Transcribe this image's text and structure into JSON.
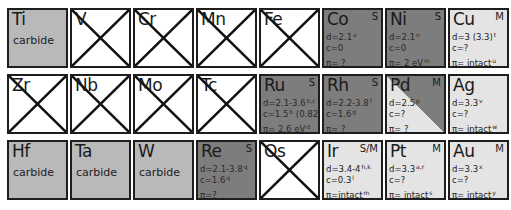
{
  "legend_colors": {
    "carbide": "#b9b9b9",
    "semiconductor_S": "#7d7d7d",
    "metal_M": "#e4e4e4",
    "crossed": "#ffffff"
  },
  "rows": [
    [
      {
        "symbol": "Ti",
        "type": "carbide",
        "sub": "carbide"
      },
      {
        "symbol": "V",
        "type": "crossed"
      },
      {
        "symbol": "Cr",
        "type": "crossed"
      },
      {
        "symbol": "Mn",
        "type": "crossed"
      },
      {
        "symbol": "Fe",
        "type": "crossed"
      },
      {
        "symbol": "Co",
        "type": "semi",
        "tag": "S",
        "d": "d=2.1",
        "d_ref": "a",
        "c": "c=0",
        "c_ref": "",
        "pi": "π= ?",
        "pi_ref": ""
      },
      {
        "symbol": "Ni",
        "type": "semi",
        "tag": "S",
        "d": "d=2.1",
        "d_ref": "n",
        "c": "c=0",
        "c_ref": "",
        "pi": "π= 2 eV",
        "pi_ref": "m"
      },
      {
        "symbol": "Cu",
        "type": "metal",
        "tag": "M",
        "d": "d=3 (3.3)",
        "d_ref": "t",
        "c": "c=?",
        "c_ref": "",
        "pi": "π= intact",
        "pi_ref": "u"
      }
    ],
    [
      {
        "symbol": "Zr",
        "type": "crossed"
      },
      {
        "symbol": "Nb",
        "type": "crossed"
      },
      {
        "symbol": "Mo",
        "type": "crossed"
      },
      {
        "symbol": "Tc",
        "type": "crossed"
      },
      {
        "symbol": "Ru",
        "type": "semi",
        "tag": "S",
        "d": "d=2.1-3.6",
        "d_ref": "b,c",
        "c": "c=1.5",
        "c_ref": "b",
        "c2": " (0.82",
        "c2_ref": "c",
        "c3": ")",
        "pi": "π= 2.6 eV",
        "pi_ref": "d"
      },
      {
        "symbol": "Rh",
        "type": "semi",
        "tag": "S",
        "d": "d=2.2-3.8",
        "d_ref": "f",
        "c": "c=1.6",
        "c_ref": "g",
        "pi": "π= ?",
        "pi_ref": ""
      },
      {
        "symbol": "Pd",
        "type": "split",
        "tag": "M",
        "d": "d=2.5",
        "d_ref": "p",
        "c": "c=?",
        "c_ref": "",
        "pi": "π= ?",
        "pi_ref": ""
      },
      {
        "symbol": "Ag",
        "type": "metal",
        "tag": "",
        "d": "d=3.3",
        "d_ref": "v",
        "c": "c=?",
        "c_ref": "",
        "pi": "π= intact",
        "pi_ref": "w"
      }
    ],
    [
      {
        "symbol": "Hf",
        "type": "carbide",
        "sub": "carbide"
      },
      {
        "symbol": "Ta",
        "type": "carbide",
        "sub": "carbide"
      },
      {
        "symbol": "W",
        "type": "carbide",
        "sub": "carbide"
      },
      {
        "symbol": "Re",
        "type": "semi",
        "tag": "S",
        "d": "d=2.1-3.8",
        "d_ref": "q",
        "c": "c=1.6",
        "c_ref": "q",
        "pi": "π=?",
        "pi_ref": ""
      },
      {
        "symbol": "Os",
        "type": "crossed"
      },
      {
        "symbol": "Ir",
        "type": "metal",
        "tag": "S/M",
        "d": "d=3.4-4",
        "d_ref": "h,k",
        "c": "c=0.3",
        "c_ref": "l",
        "pi": "π=intact",
        "pi_ref": "m"
      },
      {
        "symbol": "Pt",
        "type": "metal",
        "tag": "M",
        "d": "d=3.3",
        "d_ref": "a,r",
        "c": "c=?",
        "c_ref": "",
        "pi": "π= intact",
        "pi_ref": "s"
      },
      {
        "symbol": "Au",
        "type": "metal",
        "tag": "M",
        "d": "d=3.3",
        "d_ref": "x",
        "c": "c=?",
        "c_ref": "",
        "pi": "π= intact",
        "pi_ref": "y"
      }
    ]
  ]
}
